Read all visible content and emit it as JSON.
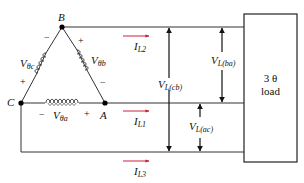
{
  "diagram": {
    "nodes": [
      {
        "id": "B",
        "label": "B"
      },
      {
        "id": "C",
        "label": "C"
      },
      {
        "id": "A",
        "label": "A"
      }
    ],
    "sources": [
      {
        "id": "Vθc",
        "main": "V",
        "sub": "θc",
        "plus": "+",
        "minus": "−"
      },
      {
        "id": "Vθb",
        "main": "V",
        "sub": "θb",
        "plus": "+",
        "minus": "−"
      },
      {
        "id": "Vθa",
        "main": "V",
        "sub": "θa",
        "plus": "+",
        "minus": "−"
      }
    ],
    "currents": [
      {
        "main": "I",
        "sub": "L2"
      },
      {
        "main": "I",
        "sub": "L1"
      },
      {
        "main": "I",
        "sub": "L3"
      }
    ],
    "line_voltages": [
      {
        "main": "V",
        "sub": "L(cb)"
      },
      {
        "main": "V",
        "sub": "L(ba)"
      },
      {
        "main": "V",
        "sub": "L(ac)"
      }
    ],
    "load": {
      "line1": "3 θ",
      "line2": "load"
    },
    "colors": {
      "wire": "#222222",
      "current_arrow": "#c8203c",
      "background": "#ffffff"
    }
  }
}
